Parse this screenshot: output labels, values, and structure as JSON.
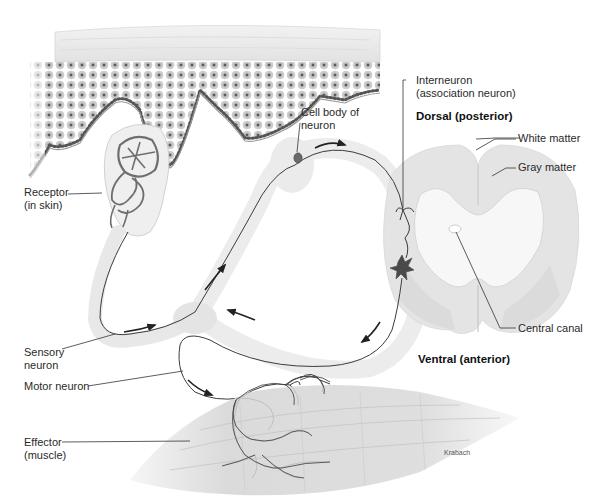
{
  "diagram": {
    "orientation": {
      "dorsal": "Dorsal (posterior)",
      "ventral": "Ventral (anterior)"
    },
    "labels": {
      "receptor": "Receptor\n(in skin)",
      "cell_body": "Cell body of\nneuron",
      "interneuron": "Interneuron\n(association neuron)",
      "white_matter": "White matter",
      "gray_matter": "Gray matter",
      "central_canal": "Central canal",
      "sensory_neuron": "Sensory\nneuron",
      "motor_neuron": "Motor neuron",
      "effector": "Effector\n(muscle)"
    },
    "credit": "Krabach",
    "colors": {
      "skin_cells": "#8a8a8a",
      "skin_dark_nuclei": "#3a3a3a",
      "spinal_white_matter": "#e6e6e6",
      "spinal_gray_matter": "#d2d2d2",
      "nerve_sheath": "#f1f1f1",
      "neuron_line": "#3c3c3c",
      "muscle": "#d6d6d6"
    }
  }
}
